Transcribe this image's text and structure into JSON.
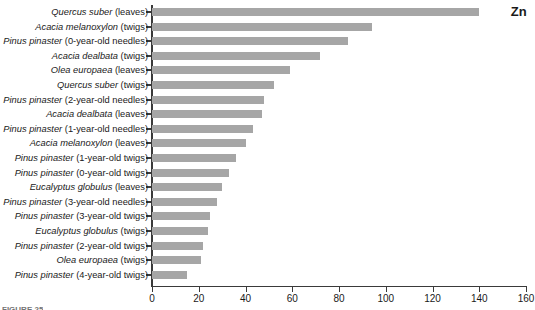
{
  "series_title": "Zn",
  "caption_fragment": "FIGURE 25",
  "colors": {
    "bar": "#a6a6a6",
    "axis": "#3a3a3a",
    "text": "#1a1a1a",
    "background": "#ffffff"
  },
  "axis": {
    "x_ticks": [
      0,
      20,
      40,
      60,
      80,
      100,
      120,
      140,
      160
    ],
    "x_min": 0,
    "x_max": 160,
    "x_step": 20
  },
  "chart_data": {
    "type": "bar",
    "orientation": "horizontal",
    "title": "Zn",
    "xlabel": "",
    "ylabel": "",
    "xlim": [
      0,
      160
    ],
    "grid": false,
    "legend": false,
    "legend_position": "none",
    "categories": [
      "Quercus suber (leaves)",
      "Acacia melanoxylon (twigs)",
      "Pinus pinaster (0-year-old needles)",
      "Acacia dealbata (twigs)",
      "Olea europaea (leaves)",
      "Quercus suber (twigs)",
      "Pinus pinaster (2-year-old needles)",
      "Acacia dealbata (leaves)",
      "Pinus pinaster (1-year-old needles)",
      "Acacia melanoxylon (leaves)",
      "Pinus pinaster (1-year-old twigs)",
      "Pinus pinaster (0-year-old twigs)",
      "Eucalyptus globulus (leaves)",
      "Pinus pinaster (3-year-old needles)",
      "Pinus pinaster (3-year-old twigs)",
      "Eucalyptus globulus (twigs)",
      "Pinus pinaster (2-year-old twigs)",
      "Olea europaea (twigs)",
      "Pinus pinaster (4-year-old twigs)"
    ],
    "category_parts": [
      {
        "species": "Quercus suber",
        "part": " (leaves)"
      },
      {
        "species": "Acacia melanoxylon",
        "part": " (twigs)"
      },
      {
        "species": "Pinus pinaster",
        "part": " (0-year-old needles)"
      },
      {
        "species": "Acacia dealbata",
        "part": " (twigs)"
      },
      {
        "species": "Olea europaea",
        "part": " (leaves)"
      },
      {
        "species": "Quercus suber",
        "part": " (twigs)"
      },
      {
        "species": "Pinus pinaster",
        "part": " (2-year-old needles)"
      },
      {
        "species": "Acacia dealbata",
        "part": " (leaves)"
      },
      {
        "species": "Pinus pinaster",
        "part": " (1-year-old needles)"
      },
      {
        "species": "Acacia melanoxylon",
        "part": " (leaves)"
      },
      {
        "species": "Pinus pinaster",
        "part": " (1-year-old twigs)"
      },
      {
        "species": "Pinus pinaster",
        "part": " (0-year-old twigs)"
      },
      {
        "species": "Eucalyptus globulus",
        "part": " (leaves)"
      },
      {
        "species": "Pinus pinaster",
        "part": " (3-year-old needles)"
      },
      {
        "species": "Pinus pinaster",
        "part": " (3-year-old twigs)"
      },
      {
        "species": "Eucalyptus globulus",
        "part": " (twigs)"
      },
      {
        "species": "Pinus pinaster",
        "part": " (2-year-old twigs)"
      },
      {
        "species": "Olea europaea",
        "part": " (twigs)"
      },
      {
        "species": "Pinus pinaster",
        "part": " (4-year-old twigs)"
      }
    ],
    "values": [
      140,
      94,
      84,
      72,
      59,
      52,
      48,
      47,
      43,
      40,
      36,
      33,
      30,
      28,
      25,
      24,
      22,
      21,
      15
    ]
  }
}
